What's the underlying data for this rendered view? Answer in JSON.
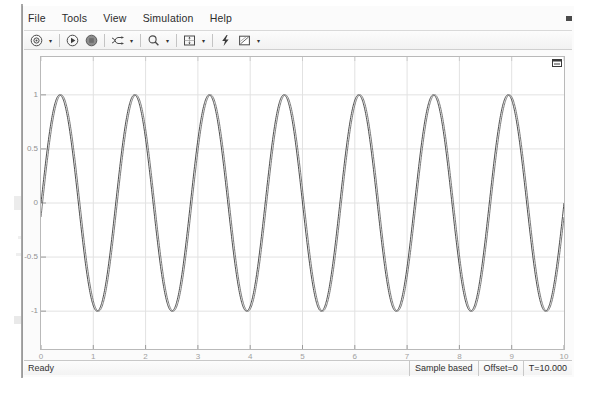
{
  "window": {
    "title": "Scope",
    "corner_icon": "maximize-axes-icon",
    "top_right_mark": "window-control-mark"
  },
  "menu": {
    "items": [
      {
        "label": "File",
        "name": "menu-file"
      },
      {
        "label": "Tools",
        "name": "menu-tools"
      },
      {
        "label": "View",
        "name": "menu-view"
      },
      {
        "label": "Simulation",
        "name": "menu-simulation"
      },
      {
        "label": "Help",
        "name": "menu-help"
      }
    ]
  },
  "toolbar": {
    "groups": [
      {
        "buttons": [
          {
            "icon": "print-icon",
            "name": "print-button",
            "dropdown": true
          }
        ]
      },
      {
        "buttons": [
          {
            "icon": "run-icon",
            "name": "run-button",
            "dropdown": false
          },
          {
            "icon": "stop-icon",
            "name": "stop-button",
            "dropdown": false
          }
        ]
      },
      {
        "buttons": [
          {
            "icon": "signal-selection-icon",
            "name": "signal-selection-button",
            "dropdown": true
          }
        ]
      },
      {
        "buttons": [
          {
            "icon": "zoom-icon",
            "name": "zoom-button",
            "dropdown": true
          }
        ]
      },
      {
        "buttons": [
          {
            "icon": "autoscale-icon",
            "name": "autoscale-button",
            "dropdown": true
          }
        ]
      },
      {
        "buttons": [
          {
            "icon": "simulation-settings-icon",
            "name": "simulation-settings-button",
            "dropdown": false
          },
          {
            "icon": "style-icon",
            "name": "style-button",
            "dropdown": true
          }
        ]
      }
    ],
    "dropdown_glyph": "▾"
  },
  "statusbar": {
    "ready_label": "Ready",
    "cells": [
      {
        "label": "Sample based",
        "name": "status-sample-mode"
      },
      {
        "label": "Offset=0",
        "name": "status-offset"
      },
      {
        "label": "T=10.000",
        "name": "status-time"
      }
    ]
  },
  "chart_data": {
    "type": "line",
    "title": "",
    "xlabel": "",
    "ylabel": "",
    "xlim": [
      0,
      10
    ],
    "ylim": [
      -1.35,
      1.35
    ],
    "grid": true,
    "grid_color": "#e2e2e2",
    "xticks": [
      0,
      1,
      2,
      3,
      4,
      5,
      6,
      7,
      8,
      9,
      10
    ],
    "xtick_labels": [
      "0",
      "1",
      "2",
      "3",
      "4",
      "5",
      "6",
      "7",
      "8",
      "9",
      "10"
    ],
    "yticks": [
      1,
      0.5,
      0,
      -0.5,
      -1
    ],
    "ytick_labels": [
      "1",
      "0.5",
      "0",
      "-0.5",
      "-1"
    ],
    "legend": null,
    "series": [
      {
        "name": "sine-wave-1",
        "color": "#3a3a3a",
        "amplitude": 1.0,
        "frequency_cycles_over_range": 7.0,
        "phase": 0.0,
        "offset": 0.0,
        "samples": 1400
      },
      {
        "name": "sine-wave-2",
        "color": "#6b6b6b",
        "amplitude": 1.0,
        "frequency_cycles_over_range": 7.0,
        "phase": -0.13,
        "offset": 0.0,
        "samples": 1400
      }
    ],
    "annotation": "Two near-identical sine waves of amplitude 1 with a small phase offset, 7 cycles across t = 0..10"
  }
}
